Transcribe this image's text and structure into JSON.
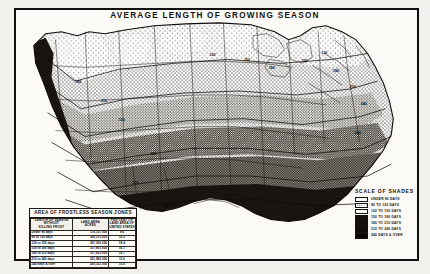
{
  "plate": {
    "title": "AVERAGE LENGTH OF GROWING SEASON"
  },
  "area_table": {
    "title": "AREA OF FROSTLESS SEASON ZONES",
    "headers": {
      "zone_l1": "LENGTH OF SEASON",
      "zone_l2": "WITHOUT",
      "zone_l3": "KILLING FROST",
      "acres_l1": "LAND AREA",
      "acres_l2": "ACRES",
      "pct_l1": "PER CENT OF",
      "pct_l2": "LAND AREA OF",
      "pct_l3": "UNITED STATES"
    },
    "rows": [
      {
        "zone": "Under  90 days",
        "acres": "176,127,000",
        "pct": "9.6"
      },
      {
        "zone": " 90 to 120 days",
        "acres": "306,373,000",
        "pct": "16.2"
      },
      {
        "zone": "120 to 150 days",
        "acres": "367,200,000",
        "pct": "19.4"
      },
      {
        "zone": "150 to 180 days",
        "acres": "317,801,000",
        "pct": "16.1"
      },
      {
        "zone": "180 to 210 days",
        "acres": "317,813,000",
        "pct": "16.7"
      },
      {
        "zone": "210 to 240 days",
        "acres": "221,983,000",
        "pct": "11.6"
      },
      {
        "zone": "240 days & over",
        "acres": "200,331,000",
        "pct": "10.6"
      }
    ]
  },
  "scale_of_shades": {
    "title": "SCALE OF SHADES",
    "entries": [
      {
        "label": "UNDER 90 DAYS",
        "swatch": "sw0"
      },
      {
        "label": "90 TO 120 DAYS",
        "swatch": "sw1"
      },
      {
        "label": "120 TO 150 DAYS",
        "swatch": "sw2"
      },
      {
        "label": "150 TO 180 DAYS",
        "swatch": "sw3"
      },
      {
        "label": "180 TO 210 DAYS",
        "swatch": "sw4"
      },
      {
        "label": "210 TO 240 DAYS",
        "swatch": "sw5"
      },
      {
        "label": "240 DAYS & OVER",
        "swatch": "sw6"
      }
    ]
  },
  "map": {
    "isoline_labels": [
      {
        "text": "120",
        "x": 196,
        "y": 47
      },
      {
        "text": "150",
        "x": 231,
        "y": 52
      },
      {
        "text": "180",
        "x": 256,
        "y": 60
      },
      {
        "text": "150",
        "x": 289,
        "y": 53
      },
      {
        "text": "120",
        "x": 309,
        "y": 45
      },
      {
        "text": "180",
        "x": 321,
        "y": 63
      },
      {
        "text": "210",
        "x": 338,
        "y": 79
      },
      {
        "text": "240",
        "x": 349,
        "y": 96
      },
      {
        "text": "150",
        "x": 104,
        "y": 112
      },
      {
        "text": "180",
        "x": 136,
        "y": 147
      },
      {
        "text": "210",
        "x": 118,
        "y": 176
      },
      {
        "text": "240",
        "x": 150,
        "y": 199
      },
      {
        "text": "240",
        "x": 343,
        "y": 126
      },
      {
        "text": "210",
        "x": 86,
        "y": 93
      },
      {
        "text": "180",
        "x": 60,
        "y": 74
      }
    ]
  },
  "colors": {
    "ink": "#15120f",
    "paper": "#fbfaf7",
    "plate_bg": "#f2f1ee"
  }
}
